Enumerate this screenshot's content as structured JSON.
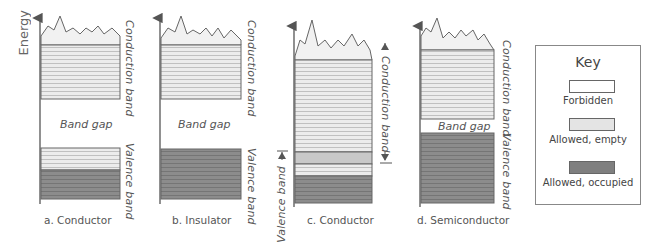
{
  "axis": {
    "ylabel": "Energy"
  },
  "colors": {
    "forbidden": "#ffffff",
    "allowed_empty": "#e8e8e8",
    "allowed_occupied": "#8a8a8a",
    "line": "#555555"
  },
  "panels": [
    {
      "id": "a",
      "caption": "a. Conductor",
      "right_label_top": "Conduction band",
      "right_label_bottom": "Valence band",
      "gap_label": "Band gap"
    },
    {
      "id": "b",
      "caption": "b. Insulator",
      "right_label_top": "Conduction band",
      "right_label_bottom": "Valence band",
      "gap_label": "Band gap"
    },
    {
      "id": "c",
      "caption": "c. Conductor",
      "right_label": "Conduction band",
      "left_label": "Valence band"
    },
    {
      "id": "d",
      "caption": "d. Semiconductor",
      "right_label_top": "Conduction band",
      "right_label_bottom": "Valence band",
      "gap_label": "Band gap"
    }
  ],
  "key": {
    "title": "Key",
    "items": [
      {
        "label": "Forbidden",
        "color": "#ffffff"
      },
      {
        "label": "Allowed, empty",
        "color": "#e8e8e8"
      },
      {
        "label": "Allowed, occupied",
        "color": "#8a8a8a"
      }
    ]
  }
}
